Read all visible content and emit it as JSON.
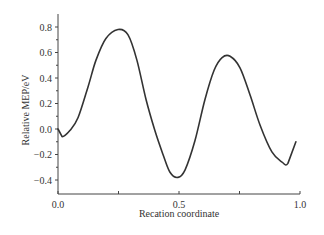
{
  "chart_data": {
    "type": "line",
    "title": "",
    "xlabel": "Recation coordinate",
    "ylabel": "Relative MEP/eV",
    "xlim": [
      0.0,
      1.0
    ],
    "ylim": [
      -0.5,
      0.9
    ],
    "x_ticks": [
      "0.0",
      "0.5",
      "1.0"
    ],
    "y_ticks": [
      "0.8",
      "0.6",
      "0.4",
      "0.2",
      "0.0",
      "-0.2",
      "-0.4"
    ],
    "grid": false,
    "legend": null,
    "series": [
      {
        "name": "MEP",
        "color": "#333333",
        "x": [
          0.0,
          0.017,
          0.05,
          0.083,
          0.124,
          0.157,
          0.198,
          0.248,
          0.289,
          0.326,
          0.364,
          0.4,
          0.434,
          0.463,
          0.496,
          0.525,
          0.566,
          0.607,
          0.645,
          0.678,
          0.711,
          0.752,
          0.793,
          0.835,
          0.884,
          0.926,
          0.95,
          0.983
        ],
        "y": [
          0.0,
          -0.06,
          -0.01,
          0.09,
          0.33,
          0.54,
          0.71,
          0.78,
          0.74,
          0.54,
          0.23,
          -0.01,
          -0.2,
          -0.34,
          -0.38,
          -0.32,
          -0.09,
          0.23,
          0.46,
          0.56,
          0.57,
          0.48,
          0.27,
          0.03,
          -0.18,
          -0.26,
          -0.27,
          -0.1
        ]
      }
    ]
  }
}
